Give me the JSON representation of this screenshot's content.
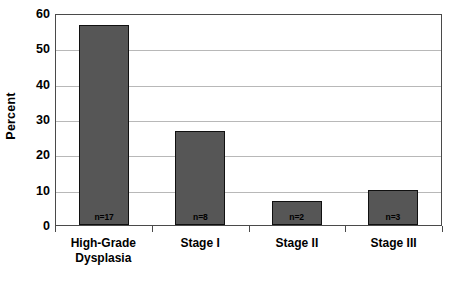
{
  "chart_data": {
    "type": "bar",
    "title": "",
    "subtitle": "",
    "xlabel": "",
    "ylabel": "Percent",
    "ylim": [
      0,
      60
    ],
    "ytick_labels": [
      "60",
      "50",
      "40",
      "30",
      "20",
      "10",
      "0"
    ],
    "ytick_values": [
      60,
      50,
      40,
      30,
      20,
      10,
      0
    ],
    "grid": true,
    "legend": false,
    "legend_position": "none",
    "orientation": "vertical",
    "categories": [
      "High-Grade Dysplasia",
      "Stage I",
      "Stage II",
      "Stage III"
    ],
    "category_lines": [
      [
        "High-Grade",
        "Dysplasia"
      ],
      [
        "Stage I",
        ""
      ],
      [
        "Stage II",
        ""
      ],
      [
        "Stage III",
        ""
      ]
    ],
    "values": [
      56.7,
      26.7,
      6.7,
      10.0
    ],
    "point_labels": [
      "n=17",
      "n=8",
      "n=2",
      "n=3"
    ],
    "counts": [
      17,
      8,
      2,
      3
    ],
    "total_n": 30,
    "bar_fill_color": "#565656",
    "bar_border_color": "#101010",
    "gridline_color": "#b8b8b8",
    "axis_color": "#4a4a4a",
    "background_color": "#ffffff",
    "text_color": "#000000"
  }
}
